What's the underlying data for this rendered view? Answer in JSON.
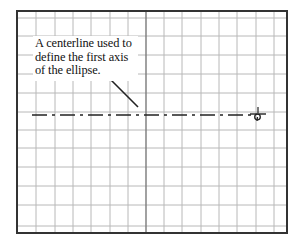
{
  "diagram": {
    "frame": {
      "left": 17,
      "top": 11,
      "right": 287,
      "bottom": 233
    },
    "grid": {
      "vertical_lines_x": [
        36,
        55,
        73,
        91,
        110,
        128,
        164,
        182,
        201,
        219,
        237,
        256,
        274
      ],
      "horizontal_lines_y": [
        18,
        36,
        55,
        74,
        93,
        112,
        130,
        148,
        167,
        186,
        205,
        226
      ],
      "center_vertical_x": 146,
      "color": "#b8b8b8",
      "center_color": "#7a7a7a",
      "border_color": "#333333"
    },
    "centerline": {
      "y": 115,
      "x_start": 32,
      "x_end": 252,
      "dash_pattern": "15 5 3 5",
      "color": "#222222"
    },
    "leader": {
      "x1": 105,
      "y1": 74,
      "x2": 138,
      "y2": 107,
      "color": "#222222"
    },
    "cursor": {
      "x": 258,
      "y": 114,
      "icon": "crosshair-pick-icon"
    },
    "callout": {
      "lines": [
        "A centerline used to",
        "define the first axis",
        "of the ellipse."
      ]
    }
  }
}
